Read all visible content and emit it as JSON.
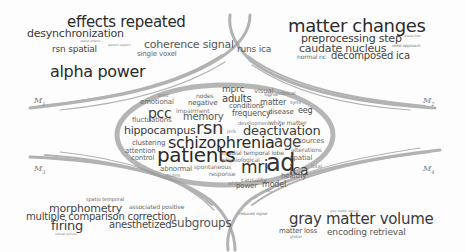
{
  "diagram": {
    "type": "word-cloud-topic-map",
    "module_labels": [
      {
        "id": "M1",
        "base": "M",
        "sub": "1",
        "x": 34,
        "y": 96
      },
      {
        "id": "M2",
        "base": "M",
        "sub": "2",
        "x": 423,
        "y": 96
      },
      {
        "id": "M3",
        "base": "M",
        "sub": "3",
        "x": 34,
        "y": 164
      },
      {
        "id": "M4",
        "base": "M",
        "sub": "4",
        "x": 423,
        "y": 164
      }
    ],
    "clusters": {
      "m1": [
        {
          "text": "effects repeated",
          "x": 67,
          "y": 15,
          "size": 15,
          "color": "#2b2b2b"
        },
        {
          "text": "desynchronization",
          "x": 27,
          "y": 28,
          "size": 11,
          "color": "#3a3a3a"
        },
        {
          "text": "rsn spatial",
          "x": 52,
          "y": 45,
          "size": 9,
          "color": "#444"
        },
        {
          "text": "spatial effects",
          "x": 80,
          "y": 40,
          "size": 3,
          "color": "#888"
        },
        {
          "text": "pattern support",
          "x": 108,
          "y": 44,
          "size": 3,
          "color": "#888"
        },
        {
          "text": "coherence signal",
          "x": 144,
          "y": 39,
          "size": 11,
          "color": "#555"
        },
        {
          "text": "single voxel",
          "x": 137,
          "y": 51,
          "size": 7,
          "color": "#666"
        },
        {
          "text": "alpha power",
          "x": 50,
          "y": 64,
          "size": 16,
          "color": "#2a2a2a"
        },
        {
          "text": "runs ica",
          "x": 237,
          "y": 45,
          "size": 9,
          "color": "#555"
        }
      ],
      "m2": [
        {
          "text": "matter changes",
          "x": 288,
          "y": 17,
          "size": 18,
          "color": "#2b2b2b"
        },
        {
          "text": "preprocessing step",
          "x": 301,
          "y": 33,
          "size": 11,
          "color": "#3b3b3b"
        },
        {
          "text": "caudate nucleus",
          "x": 299,
          "y": 43,
          "size": 11,
          "color": "#444"
        },
        {
          "text": "normal nc",
          "x": 297,
          "y": 54,
          "size": 6,
          "color": "#666"
        },
        {
          "text": "decomposed ica",
          "x": 331,
          "y": 51,
          "size": 10,
          "color": "#444"
        },
        {
          "text": "spatial filter",
          "x": 404,
          "y": 35,
          "size": 3,
          "color": "#888"
        },
        {
          "text": "seed approach",
          "x": 392,
          "y": 44,
          "size": 4,
          "color": "#777"
        }
      ],
      "center": [
        {
          "text": "mprc",
          "x": 222,
          "y": 85,
          "size": 9,
          "color": "#555"
        },
        {
          "text": "visual",
          "x": 254,
          "y": 88,
          "size": 7,
          "color": "#777"
        },
        {
          "text": "bold",
          "x": 158,
          "y": 93,
          "size": 5,
          "color": "#888"
        },
        {
          "text": "nodes",
          "x": 196,
          "y": 93,
          "size": 6,
          "color": "#666"
        },
        {
          "text": "adults",
          "x": 222,
          "y": 94,
          "size": 10,
          "color": "#444"
        },
        {
          "text": "signal",
          "x": 264,
          "y": 92,
          "size": 5,
          "color": "#777"
        },
        {
          "text": "clinical",
          "x": 279,
          "y": 91,
          "size": 5,
          "color": "#777"
        },
        {
          "text": "emotional",
          "x": 140,
          "y": 99,
          "size": 7,
          "color": "#666"
        },
        {
          "text": "negative",
          "x": 188,
          "y": 100,
          "size": 7,
          "color": "#555"
        },
        {
          "text": "conditions",
          "x": 229,
          "y": 103,
          "size": 7,
          "color": "#555"
        },
        {
          "text": "matter",
          "x": 260,
          "y": 99,
          "size": 8,
          "color": "#555"
        },
        {
          "text": "syns",
          "x": 290,
          "y": 100,
          "size": 5,
          "color": "#777"
        },
        {
          "text": "pcc",
          "x": 148,
          "y": 106,
          "size": 14,
          "color": "#3a3a3a"
        },
        {
          "text": "impairment",
          "x": 176,
          "y": 108,
          "size": 6,
          "color": "#777"
        },
        {
          "text": "memory",
          "x": 183,
          "y": 112,
          "size": 10,
          "color": "#555"
        },
        {
          "text": "frequency",
          "x": 232,
          "y": 110,
          "size": 8,
          "color": "#555"
        },
        {
          "text": "disease",
          "x": 268,
          "y": 109,
          "size": 7,
          "color": "#555"
        },
        {
          "text": "eeg",
          "x": 298,
          "y": 107,
          "size": 8,
          "color": "#444"
        },
        {
          "text": "fluctuations",
          "x": 132,
          "y": 117,
          "size": 7,
          "color": "#666"
        },
        {
          "text": "development",
          "x": 238,
          "y": 121,
          "size": 5,
          "color": "#777"
        },
        {
          "text": "white matter",
          "x": 269,
          "y": 120,
          "size": 6,
          "color": "#666"
        },
        {
          "text": "hippocampus",
          "x": 124,
          "y": 125,
          "size": 11,
          "color": "#3b3b3b"
        },
        {
          "text": "rsn",
          "x": 196,
          "y": 119,
          "size": 18,
          "color": "#333"
        },
        {
          "text": "jerk",
          "x": 227,
          "y": 129,
          "size": 5,
          "color": "#888"
        },
        {
          "text": "deactivation",
          "x": 243,
          "y": 124,
          "size": 13,
          "color": "#3a3a3a"
        },
        {
          "text": "clustering",
          "x": 132,
          "y": 140,
          "size": 7,
          "color": "#555"
        },
        {
          "text": "schizophrenia",
          "x": 168,
          "y": 135,
          "size": 16,
          "color": "#2a2a2a"
        },
        {
          "text": "age",
          "x": 274,
          "y": 135,
          "size": 15,
          "color": "#444"
        },
        {
          "text": "sources",
          "x": 298,
          "y": 138,
          "size": 7,
          "color": "#666"
        },
        {
          "text": "attention",
          "x": 125,
          "y": 148,
          "size": 7,
          "color": "#666"
        },
        {
          "text": "medial temporal lobe",
          "x": 222,
          "y": 150,
          "size": 6,
          "color": "#666"
        },
        {
          "text": "alterations",
          "x": 291,
          "y": 147,
          "size": 6,
          "color": "#777"
        },
        {
          "text": "control",
          "x": 131,
          "y": 155,
          "size": 7,
          "color": "#666"
        },
        {
          "text": "patients",
          "x": 157,
          "y": 145,
          "size": 20,
          "color": "#2a2a2a"
        },
        {
          "text": "physiological",
          "x": 222,
          "y": 157,
          "size": 6,
          "color": "#777"
        },
        {
          "text": "spatial",
          "x": 290,
          "y": 155,
          "size": 7,
          "color": "#666"
        },
        {
          "text": "ad",
          "x": 266,
          "y": 151,
          "size": 24,
          "color": "#333"
        },
        {
          "text": "spontaneous",
          "x": 194,
          "y": 164,
          "size": 6,
          "color": "#777"
        },
        {
          "text": "abnormal",
          "x": 160,
          "y": 166,
          "size": 7,
          "color": "#666"
        },
        {
          "text": "mri",
          "x": 241,
          "y": 159,
          "size": 17,
          "color": "#333"
        },
        {
          "text": "ica",
          "x": 289,
          "y": 163,
          "size": 14,
          "color": "#444"
        },
        {
          "text": "total",
          "x": 311,
          "y": 164,
          "size": 5,
          "color": "#888"
        },
        {
          "text": "mutes",
          "x": 165,
          "y": 173,
          "size": 5,
          "color": "#888"
        },
        {
          "text": "response",
          "x": 209,
          "y": 171,
          "size": 6,
          "color": "#777"
        },
        {
          "text": "causality",
          "x": 241,
          "y": 177,
          "size": 6,
          "color": "#777"
        },
        {
          "text": "healthy",
          "x": 281,
          "y": 173,
          "size": 7,
          "color": "#666"
        },
        {
          "text": "white",
          "x": 228,
          "y": 181,
          "size": 5,
          "color": "#888"
        },
        {
          "text": "power",
          "x": 236,
          "y": 183,
          "size": 7,
          "color": "#555"
        },
        {
          "text": "model",
          "x": 262,
          "y": 181,
          "size": 8,
          "color": "#555"
        },
        {
          "text": "nc",
          "x": 266,
          "y": 188,
          "size": 5,
          "color": "#888"
        }
      ],
      "m3": [
        {
          "text": "spatio temporal",
          "x": 86,
          "y": 197,
          "size": 5,
          "color": "#666"
        },
        {
          "text": "morphometry",
          "x": 49,
          "y": 203,
          "size": 11,
          "color": "#444"
        },
        {
          "text": "associated positive",
          "x": 129,
          "y": 204,
          "size": 6,
          "color": "#666"
        },
        {
          "text": "multiple comparison correction",
          "x": 26,
          "y": 212,
          "size": 10,
          "color": "#444"
        },
        {
          "text": "firing",
          "x": 51,
          "y": 219,
          "size": 13,
          "color": "#3a3a3a"
        },
        {
          "text": "anesthetized",
          "x": 109,
          "y": 220,
          "size": 10,
          "color": "#444"
        },
        {
          "text": "subgroups",
          "x": 171,
          "y": 217,
          "size": 12,
          "color": "#555"
        },
        {
          "text": "cellular activity",
          "x": 55,
          "y": 233,
          "size": 3,
          "color": "#888"
        }
      ],
      "m4": [
        {
          "text": "reduced signal",
          "x": 239,
          "y": 212,
          "size": 4,
          "color": "#777"
        },
        {
          "text": "gray matter density",
          "x": 330,
          "y": 210,
          "size": 3,
          "color": "#888"
        },
        {
          "text": "gray matter volume",
          "x": 289,
          "y": 212,
          "size": 15,
          "color": "#3a3a3a"
        },
        {
          "text": "matter loss",
          "x": 279,
          "y": 228,
          "size": 7,
          "color": "#555"
        },
        {
          "text": "global",
          "x": 290,
          "y": 235,
          "size": 4,
          "color": "#888"
        },
        {
          "text": "encoding retrieval",
          "x": 327,
          "y": 228,
          "size": 9,
          "color": "#555"
        }
      ]
    },
    "colors": {
      "background": "#fdfdfd",
      "stroke": "#9a9a9a",
      "ellipse": "#a8a8a8",
      "text_dark": "#2a2a2a"
    }
  }
}
